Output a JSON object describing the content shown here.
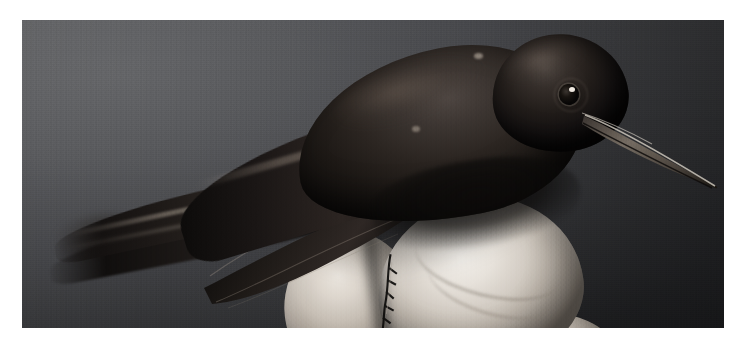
{
  "image": {
    "kind": "photograph",
    "title": "Black hummingbird held in a human hand",
    "subject": "hummingbird",
    "orientation": "landscape",
    "treatment": "color photograph, desaturated studio lighting",
    "caption": "",
    "frame": {
      "border_color": "#ffffff",
      "border_px": 20,
      "photo_x": 22,
      "photo_y": 20,
      "photo_width": 702,
      "photo_height": 308
    }
  },
  "colors": {
    "page_background": "#ffffff",
    "backdrop_light": "#5b5c5f",
    "backdrop_mid": "#45464a",
    "backdrop_dark": "#232427",
    "plumage_highlight": "#4d4541",
    "plumage_mid": "#2a2420",
    "plumage_shadow": "#0d0b0a",
    "beak_highlight": "#cfc8be",
    "beak_shadow": "#1a1715",
    "skin_highlight": "#f2efea",
    "skin_mid": "#c6beb4",
    "skin_shadow": "#5f5851",
    "eye_catchlight": "#efe9e1"
  },
  "scene": {
    "elements": [
      {
        "name": "backdrop",
        "label": "Dark gray studio backdrop",
        "note": "brighter toward upper left, falls off to near black at right and bottom"
      },
      {
        "name": "bird-head",
        "label": "Hummingbird head",
        "note": "dark iridescent plumage, round black eye with single white catchlight"
      },
      {
        "name": "bird-beak",
        "label": "Long straight needle beak",
        "note": "angles down-right, pale specular edge along the upper mandible"
      },
      {
        "name": "bird-body",
        "label": "Hummingbird body and back"
      },
      {
        "name": "bird-wing",
        "label": "Folded wing with long primary feathers"
      },
      {
        "name": "bird-tail",
        "label": "Long tail feathers trailing to the left, slightly out of focus at the tips"
      },
      {
        "name": "bird-claws",
        "label": "Tiny feet gripping between the fingers"
      },
      {
        "name": "hand",
        "label": "Human hand holding the bird"
      },
      {
        "name": "finger-thumb",
        "label": "Bright thumb pad under the bird"
      },
      {
        "name": "finger-index",
        "label": "Second finger, left of the thumb"
      },
      {
        "name": "finger-lower",
        "label": "Lower finger at the bottom edge"
      }
    ]
  },
  "bird_geometry": {
    "eye_center": [
      547,
      75
    ],
    "beak_base": [
      566,
      98
    ],
    "beak_tip": [
      696,
      168
    ],
    "tail_tip": [
      30,
      236
    ],
    "body_span_px": 560
  }
}
